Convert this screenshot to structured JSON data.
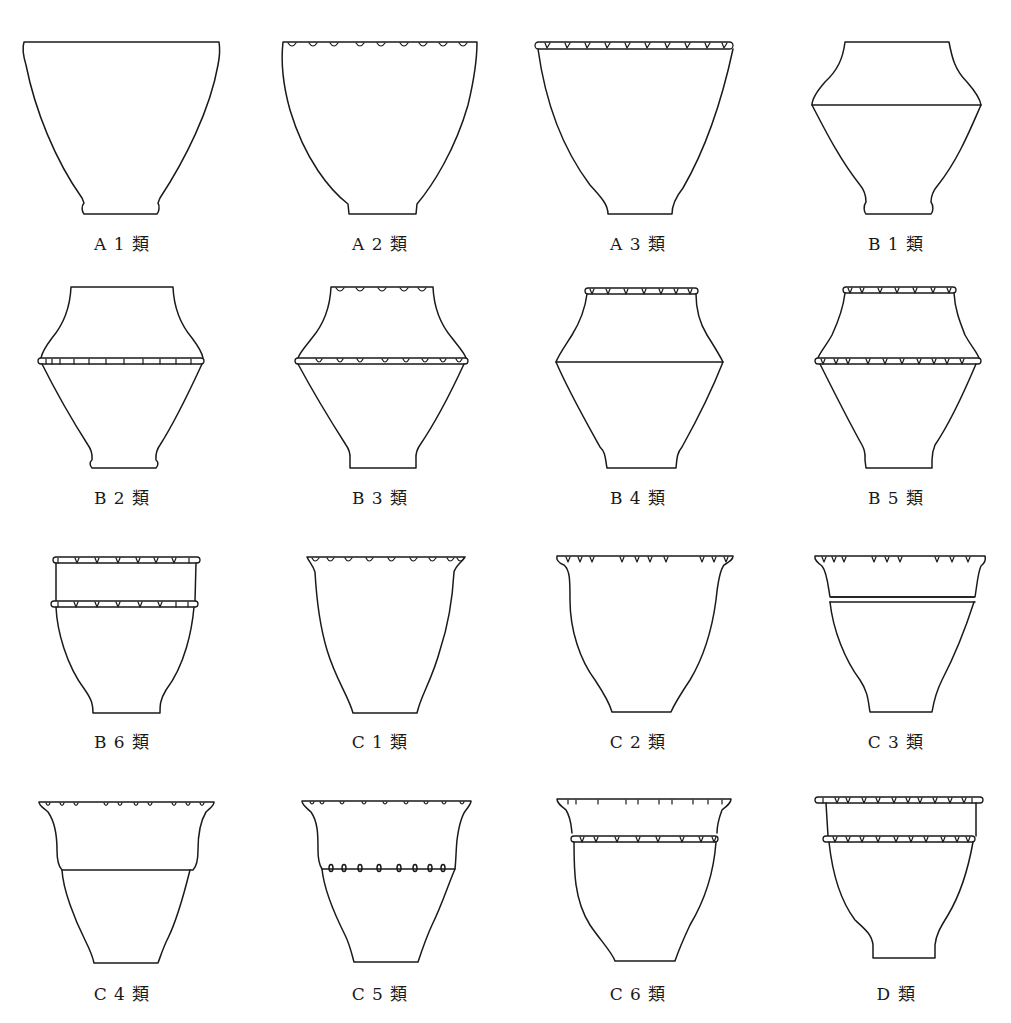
{
  "figure": {
    "title": "",
    "type": "pottery vessel typology chart",
    "suffix": "類",
    "vessels": [
      {
        "id": "A1",
        "label": "A 1 類",
        "rim_decoration": "none",
        "neck_band": "none"
      },
      {
        "id": "A2",
        "label": "A 2 類",
        "rim_decoration": "notches below rim",
        "neck_band": "none"
      },
      {
        "id": "A3",
        "label": "A 3 類",
        "rim_decoration": "notched applied band",
        "neck_band": "none"
      },
      {
        "id": "B1",
        "label": "B 1 類",
        "rim_decoration": "none",
        "neck_band": "plain carination line"
      },
      {
        "id": "B2",
        "label": "B 2 類",
        "rim_decoration": "none",
        "neck_band": "notched applied band at shoulder"
      },
      {
        "id": "B3",
        "label": "B 3 類",
        "rim_decoration": "notches below rim",
        "neck_band": "notched applied band at shoulder"
      },
      {
        "id": "B4",
        "label": "B 4 類",
        "rim_decoration": "notched applied band",
        "neck_band": "plain carination line"
      },
      {
        "id": "B5",
        "label": "B 5 類",
        "rim_decoration": "notched applied band",
        "neck_band": "notched applied band at shoulder"
      },
      {
        "id": "B6",
        "label": "B 6 類",
        "rim_decoration": "notched applied band",
        "neck_band": "notched applied band"
      },
      {
        "id": "C1",
        "label": "C 1 類",
        "rim_decoration": "notches below flared rim",
        "neck_band": "none"
      },
      {
        "id": "C2",
        "label": "C 2 類",
        "rim_decoration": "notched flared rim band",
        "neck_band": "none"
      },
      {
        "id": "C3",
        "label": "C 3 類",
        "rim_decoration": "notched flared rim band",
        "neck_band": "double line"
      },
      {
        "id": "C4",
        "label": "C 4 類",
        "rim_decoration": "notched flared rim band",
        "neck_band": "plain line"
      },
      {
        "id": "C5",
        "label": "C 5 類",
        "rim_decoration": "notched flared rim band",
        "neck_band": "row of oval perforations"
      },
      {
        "id": "C6",
        "label": "C 6 類",
        "rim_decoration": "notched flared rim band",
        "neck_band": "notched applied band"
      },
      {
        "id": "D",
        "label": "D 類",
        "rim_decoration": "notched applied band",
        "neck_band": "notched applied band"
      }
    ]
  }
}
